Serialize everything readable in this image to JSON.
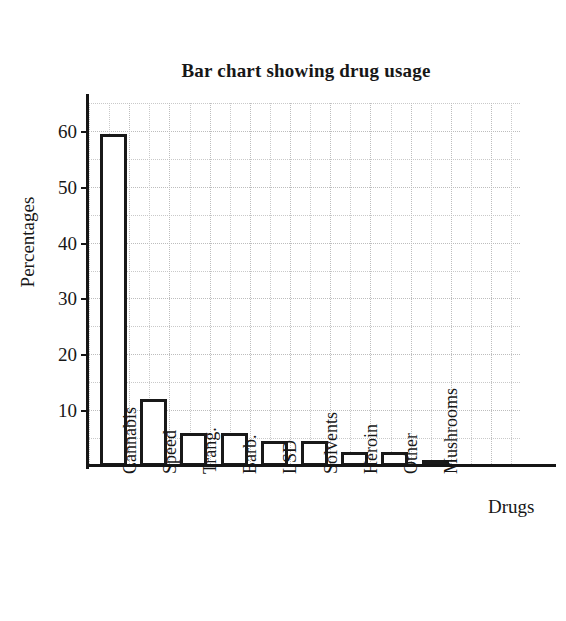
{
  "chart_data": {
    "type": "bar",
    "title": "Bar chart showing drug usage",
    "xlabel": "Drugs",
    "ylabel": "Percentages",
    "categories": [
      "Cannabis",
      "Speed",
      "Trang.",
      "Barb.",
      "LSD",
      "Solvents",
      "Heroin",
      "Other",
      "Mushrooms"
    ],
    "values": [
      59.5,
      12,
      6,
      6,
      4.5,
      4.5,
      2.5,
      2.5,
      1
    ],
    "ylim": [
      0,
      65
    ],
    "yticks": [
      10,
      20,
      30,
      40,
      50,
      60
    ],
    "ytick_labels": [
      "10",
      "20",
      "30",
      "40",
      "50",
      "60"
    ],
    "y_minor_interval": 5,
    "grid": true,
    "grid_style": "dotted",
    "legend": false,
    "bar_fill": "#ffffff",
    "bar_edge": "#191919",
    "grid_color": "#c9c9c9",
    "axis_color": "#151515",
    "background": "#ffffff"
  }
}
